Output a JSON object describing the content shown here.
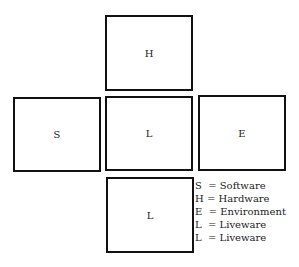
{
  "diagram": {
    "boxes": [
      {
        "id": "top",
        "label": "H"
      },
      {
        "id": "left",
        "label": "S"
      },
      {
        "id": "center",
        "label": "L"
      },
      {
        "id": "right",
        "label": "E"
      },
      {
        "id": "bottom",
        "label": "L"
      }
    ],
    "legend": [
      "S  = Software",
      "H = Hardware",
      "E  = Environment",
      "L  = Liveware",
      "L  = Liveware"
    ]
  }
}
